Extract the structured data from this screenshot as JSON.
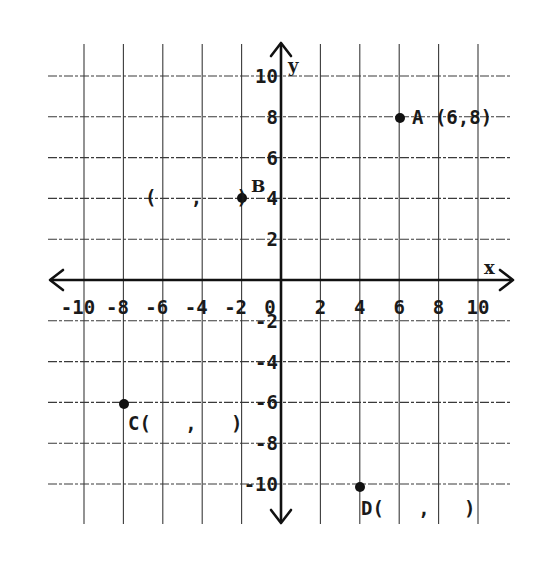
{
  "chart_data": {
    "type": "scatter",
    "title": "",
    "xlabel": "x",
    "ylabel": "y",
    "xlim": [
      -10,
      10
    ],
    "ylim": [
      -10,
      10
    ],
    "grid": true,
    "x_ticks": [
      -10,
      -8,
      -6,
      -4,
      -2,
      0,
      2,
      4,
      6,
      8,
      10
    ],
    "y_ticks": [
      -10,
      -8,
      -6,
      -4,
      -2,
      2,
      4,
      6,
      8,
      10
    ],
    "x_tick_labels": [
      "-10",
      "-8",
      "-6",
      "-4",
      "-2",
      "0",
      "2",
      "4",
      "6",
      "8",
      "10"
    ],
    "y_tick_labels": [
      "10",
      "8",
      "6",
      "4",
      "2",
      "-2",
      "-4",
      "-6",
      "-8",
      "-10"
    ],
    "points": [
      {
        "name": "A",
        "x": 6,
        "y": 8,
        "label": "A (6,8)"
      },
      {
        "name": "B",
        "x": -2,
        "y": 4,
        "label": "B",
        "blank_label": "(   ,   )"
      },
      {
        "name": "C",
        "x": -8,
        "y": -6,
        "label": "C(   ,   )"
      },
      {
        "name": "D",
        "x": 4,
        "y": -10,
        "label": "D(   ,   )"
      }
    ]
  },
  "axes": {
    "x_name": "x",
    "y_name": "y",
    "origin_label": "0"
  },
  "labels": {
    "A": "A (6,8)",
    "B_letter": "B",
    "B_blank": "(   ,   )",
    "C": "C(   ,   )",
    "D": "D(   ,   )"
  },
  "colors": {
    "ink": "#111111",
    "grid": "#3a3a3a",
    "background": "#ffffff"
  }
}
